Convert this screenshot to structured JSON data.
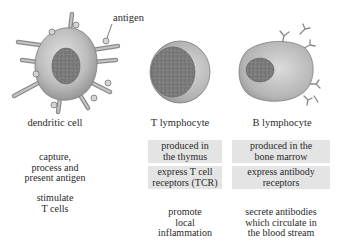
{
  "annotations": {
    "antigen": "antigen"
  },
  "cells": [
    {
      "name": "dendritic cell",
      "function": "capture,\nprocess and\npresent antigen",
      "role": "stimulate\nT cells"
    },
    {
      "name": "T lymphocyte",
      "origin": "produced in\nthe thymus",
      "receptor": "express T cell\nreceptors (TCR)",
      "role": "promote\nlocal\ninflammation"
    },
    {
      "name": "B lymphocyte",
      "origin": "produced in the\nbone marrow",
      "receptor": "express antibody\nreceptors",
      "role": "secrete antibodies\nwhich circulate in\nthe blood stream"
    }
  ],
  "colors": {
    "cell_body": "#b8b8b8",
    "nucleus": "#7a7a7a",
    "row_shading": "#e4e4e4",
    "text": "#2a2a2a"
  }
}
